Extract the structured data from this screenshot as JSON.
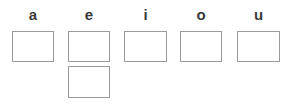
{
  "worksheet": {
    "title": "Vowel letter boxes",
    "background_color": "#ffffff",
    "box_border_color": "#9a9a9a",
    "box_fill_color": "#ffffff",
    "label_color": "#3a3a3a",
    "columns": [
      {
        "id": "column-a",
        "label": "a",
        "boxes": [
          {
            "id": "box-a-1",
            "row": 1,
            "value": ""
          }
        ]
      },
      {
        "id": "column-e",
        "label": "e",
        "boxes": [
          {
            "id": "box-e-1",
            "row": 1,
            "value": ""
          },
          {
            "id": "box-e-2",
            "row": 2,
            "value": ""
          }
        ]
      },
      {
        "id": "column-i",
        "label": "i",
        "boxes": [
          {
            "id": "box-i-1",
            "row": 1,
            "value": ""
          }
        ]
      },
      {
        "id": "column-o",
        "label": "o",
        "boxes": [
          {
            "id": "box-o-1",
            "row": 1,
            "value": ""
          }
        ]
      },
      {
        "id": "column-u",
        "label": "u",
        "boxes": [
          {
            "id": "box-u-1",
            "row": 1,
            "value": ""
          }
        ]
      }
    ]
  }
}
